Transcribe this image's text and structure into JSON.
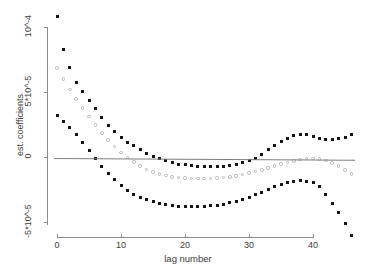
{
  "chart_data": {
    "type": "scatter",
    "title": "",
    "xlabel": "lag number",
    "ylabel": "est. coefficients",
    "xlim": [
      -1,
      47
    ],
    "ylim": [
      -6.2e-05,
      0.000115
    ],
    "grid": false,
    "legend": "none",
    "xticks": [
      0,
      10,
      20,
      30,
      40
    ],
    "xtick_labels": [
      "0",
      "10",
      "20",
      "30",
      "40"
    ],
    "yticks": [
      0.0001,
      5e-05,
      0,
      -5e-05
    ],
    "ytick_labels": [
      "10^-4",
      "5*10^-5",
      "0",
      "-5*10^-5"
    ],
    "annotations": [
      "horizontal reference line at y = 0"
    ],
    "x": [
      0,
      1,
      2,
      3,
      4,
      5,
      6,
      7,
      8,
      9,
      10,
      11,
      12,
      13,
      14,
      15,
      16,
      17,
      18,
      19,
      20,
      21,
      22,
      23,
      24,
      25,
      26,
      27,
      28,
      29,
      30,
      31,
      32,
      33,
      34,
      35,
      36,
      37,
      38,
      39,
      40,
      41,
      42,
      43,
      44,
      45,
      46
    ],
    "series": [
      {
        "name": "upper confidence band",
        "marker": "filled-square",
        "color": "#141414",
        "values": [
          0.0001078,
          8.3e-05,
          6.9e-05,
          5.75e-05,
          5.05e-05,
          4.35e-05,
          3.75e-05,
          3.05e-05,
          2.45e-05,
          1.95e-05,
          1.5e-05,
          1.15e-05,
          8.5e-06,
          5.5e-06,
          3e-06,
          5e-07,
          -1.5e-06,
          -3e-06,
          -4.5e-06,
          -5.5e-06,
          -6e-06,
          -6.5e-06,
          -7e-06,
          -7.5e-06,
          -7.5e-06,
          -7.5e-06,
          -7e-06,
          -6.5e-06,
          -5.5e-06,
          -4.5e-06,
          -3e-06,
          -1e-06,
          2e-06,
          5.5e-06,
          9e-06,
          1.2e-05,
          1.45e-05,
          1.65e-05,
          1.75e-05,
          1.72e-05,
          1.55e-05,
          1.4e-05,
          1.35e-05,
          1.38e-05,
          1.4e-05,
          1.52e-05,
          1.72e-05
        ]
      },
      {
        "name": "point estimate",
        "marker": "open-circle",
        "color": "#b4b4b4",
        "values": [
          6.85e-05,
          6e-05,
          5.2e-05,
          4.45e-05,
          3.75e-05,
          3.1e-05,
          2.45e-05,
          1.85e-05,
          1.3e-05,
          8e-06,
          3.5e-06,
          -5e-07,
          -4e-06,
          -7e-06,
          -9.5e-06,
          -1.15e-05,
          -1.3e-05,
          -1.42e-05,
          -1.52e-05,
          -1.58e-05,
          -1.62e-05,
          -1.64e-05,
          -1.65e-05,
          -1.65e-05,
          -1.64e-05,
          -1.62e-05,
          -1.58e-05,
          -1.52e-05,
          -1.44e-05,
          -1.35e-05,
          -1.24e-05,
          -1.12e-05,
          -9.8e-06,
          -8.4e-06,
          -7e-06,
          -5.6e-06,
          -4.2e-06,
          -3e-06,
          -2e-06,
          -1.3e-06,
          -1e-06,
          -1.4e-06,
          -2.6e-06,
          -4.5e-06,
          -7e-06,
          -1e-05,
          -1.32e-05
        ]
      },
      {
        "name": "lower confidence band",
        "marker": "filled-square",
        "color": "#141414",
        "values": [
          3.2e-05,
          2.7e-05,
          2.25e-05,
          1.7e-05,
          1.1e-05,
          5e-06,
          -1e-06,
          -7e-06,
          -1.25e-05,
          -1.75e-05,
          -2.2e-05,
          -2.55e-05,
          -2.85e-05,
          -3.1e-05,
          -3.3e-05,
          -3.45e-05,
          -3.58e-05,
          -3.68e-05,
          -3.75e-05,
          -3.8e-05,
          -3.82e-05,
          -3.83e-05,
          -3.82e-05,
          -3.8e-05,
          -3.76e-05,
          -3.7e-05,
          -3.62e-05,
          -3.52e-05,
          -3.4e-05,
          -3.25e-05,
          -3.08e-05,
          -2.9e-05,
          -2.7e-05,
          -2.5e-05,
          -2.3e-05,
          -2.1e-05,
          -1.95e-05,
          -1.85e-05,
          -1.82e-05,
          -1.85e-05,
          -1.95e-05,
          -2.3e-05,
          -2.85e-05,
          -3.55e-05,
          -4.3e-05,
          -5.1e-05,
          -6e-05
        ]
      }
    ]
  }
}
